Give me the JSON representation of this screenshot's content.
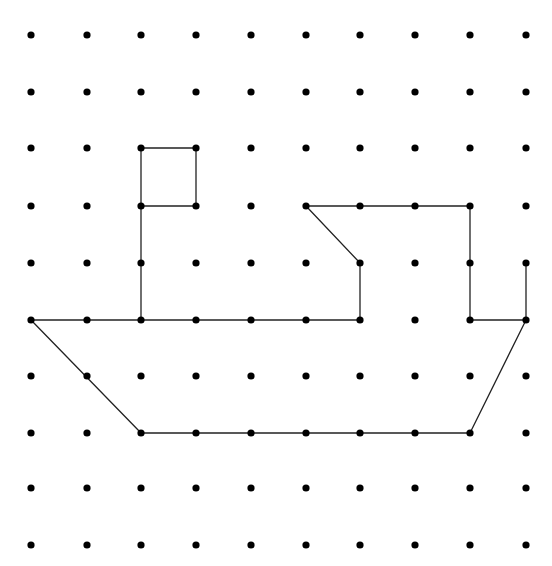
{
  "diagram": {
    "grid": {
      "cols": 10,
      "rows": 10,
      "col_x": [
        31,
        87,
        141,
        196,
        251,
        306,
        360,
        415,
        470,
        526
      ],
      "row_y": [
        35,
        92,
        148,
        206,
        263,
        320,
        376,
        433,
        488,
        545
      ],
      "dot_radius": 3.6,
      "dot_color": "#000000"
    },
    "line_color": "#222222",
    "line_width": 1.3,
    "shapes": [
      {
        "name": "flag",
        "points": [
          [
            2,
            2
          ],
          [
            3,
            2
          ],
          [
            3,
            3
          ],
          [
            2,
            3
          ]
        ],
        "closed": true
      },
      {
        "name": "mast",
        "points": [
          [
            2,
            3
          ],
          [
            2,
            5
          ]
        ],
        "closed": false
      },
      {
        "name": "cabin",
        "points": [
          [
            6,
            5
          ],
          [
            6,
            4
          ],
          [
            5,
            3
          ],
          [
            8,
            3
          ],
          [
            8,
            5
          ],
          [
            9,
            5
          ],
          [
            9,
            4
          ]
        ],
        "closed": false
      },
      {
        "name": "deck",
        "points": [
          [
            0,
            5
          ],
          [
            6,
            5
          ]
        ],
        "closed": false
      },
      {
        "name": "hull",
        "points": [
          [
            0,
            5
          ],
          [
            2,
            7
          ],
          [
            8,
            7
          ],
          [
            9,
            5
          ]
        ],
        "closed": false
      }
    ]
  }
}
